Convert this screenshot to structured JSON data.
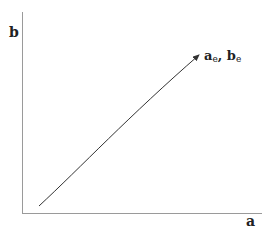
{
  "diagram": {
    "type": "phase-path",
    "axes": {
      "x_label": "a",
      "y_label": "b"
    },
    "path": {
      "description": "monotonic increasing trajectory ending at the equilibrium point",
      "direction": "toward endpoint"
    },
    "endpoint_label": {
      "a_base": "a",
      "a_sub": "e",
      "separator": ", ",
      "b_base": "b",
      "b_sub": "e"
    },
    "colors": {
      "axis": "#9a9a9a",
      "curve": "#333333",
      "text": "#222222"
    }
  }
}
